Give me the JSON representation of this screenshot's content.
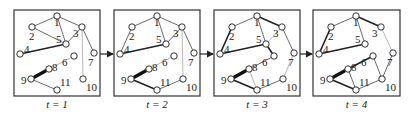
{
  "figure": {
    "panels": [
      {
        "label": "t = 1",
        "edges": [
          {
            "from": 1,
            "to": 2,
            "weight": "thin"
          },
          {
            "from": 1,
            "to": 3,
            "weight": "thin"
          },
          {
            "from": 1,
            "to": 5,
            "weight": "thin"
          },
          {
            "from": 2,
            "to": 5,
            "weight": "thin"
          },
          {
            "from": 3,
            "to": 5,
            "weight": "thin"
          },
          {
            "from": 3,
            "to": 7,
            "weight": "thin"
          },
          {
            "from": 3,
            "to": 10,
            "weight": "faint"
          },
          {
            "from": 4,
            "to": 5,
            "weight": "medium"
          },
          {
            "from": 8,
            "to": 6,
            "weight": "faint"
          },
          {
            "from": 9,
            "to": 8,
            "weight": "thick"
          },
          {
            "from": 9,
            "to": 11,
            "weight": "thin"
          }
        ]
      },
      {
        "label": "t = 2",
        "edges": [
          {
            "from": 1,
            "to": 2,
            "weight": "thin"
          },
          {
            "from": 1,
            "to": 3,
            "weight": "thin"
          },
          {
            "from": 1,
            "to": 5,
            "weight": "thin"
          },
          {
            "from": 2,
            "to": 4,
            "weight": "thin"
          },
          {
            "from": 3,
            "to": 5,
            "weight": "thin"
          },
          {
            "from": 3,
            "to": 7,
            "weight": "thin"
          },
          {
            "from": 3,
            "to": 10,
            "weight": "faint"
          },
          {
            "from": 4,
            "to": 5,
            "weight": "medium"
          },
          {
            "from": 8,
            "to": 6,
            "weight": "faint"
          },
          {
            "from": 9,
            "to": 8,
            "weight": "thick"
          },
          {
            "from": 9,
            "to": 11,
            "weight": "medium"
          },
          {
            "from": 11,
            "to": 10,
            "weight": "thin"
          }
        ]
      },
      {
        "label": "t = 3",
        "edges": [
          {
            "from": 1,
            "to": 2,
            "weight": "thin"
          },
          {
            "from": 1,
            "to": 3,
            "weight": "medium"
          },
          {
            "from": 1,
            "to": 5,
            "weight": "thin"
          },
          {
            "from": 2,
            "to": 4,
            "weight": "medium"
          },
          {
            "from": 3,
            "to": 5,
            "weight": "faint"
          },
          {
            "from": 3,
            "to": 7,
            "weight": "thin"
          },
          {
            "from": 4,
            "to": 5,
            "weight": "medium"
          },
          {
            "from": 5,
            "to": 6,
            "weight": "medium"
          },
          {
            "from": 7,
            "to": 10,
            "weight": "faint"
          },
          {
            "from": 6,
            "to": 8,
            "weight": "thin"
          },
          {
            "from": 8,
            "to": 11,
            "weight": "faint"
          },
          {
            "from": 9,
            "to": 8,
            "weight": "thick"
          },
          {
            "from": 9,
            "to": 11,
            "weight": "medium"
          },
          {
            "from": 11,
            "to": 10,
            "weight": "thin"
          }
        ]
      },
      {
        "label": "t = 4",
        "edges": [
          {
            "from": 1,
            "to": 2,
            "weight": "thin"
          },
          {
            "from": 1,
            "to": 3,
            "weight": "medium"
          },
          {
            "from": 1,
            "to": 5,
            "weight": "thin"
          },
          {
            "from": 2,
            "to": 4,
            "weight": "medium"
          },
          {
            "from": 3,
            "to": 7,
            "weight": "faint"
          },
          {
            "from": 4,
            "to": 5,
            "weight": "medium"
          },
          {
            "from": 6,
            "to": 8,
            "weight": "medium"
          },
          {
            "from": 6,
            "to": 10,
            "weight": "thin"
          },
          {
            "from": 7,
            "to": 10,
            "weight": "thin"
          },
          {
            "from": 8,
            "to": 11,
            "weight": "thin"
          },
          {
            "from": 9,
            "to": 8,
            "weight": "thick"
          },
          {
            "from": 9,
            "to": 11,
            "weight": "medium"
          },
          {
            "from": 11,
            "to": 10,
            "weight": "thin"
          }
        ]
      }
    ],
    "nodes": [
      {
        "id": 1,
        "label": "1"
      },
      {
        "id": 2,
        "label": "2"
      },
      {
        "id": 3,
        "label": "3"
      },
      {
        "id": 4,
        "label": "4"
      },
      {
        "id": 5,
        "label": "5"
      },
      {
        "id": 6,
        "label": "6"
      },
      {
        "id": 7,
        "label": "7"
      },
      {
        "id": 8,
        "label": "8"
      },
      {
        "id": 9,
        "label": "9"
      },
      {
        "id": 10,
        "label": "10"
      },
      {
        "id": 11,
        "label": "11"
      }
    ],
    "arrow_color": "#222222",
    "edge_color": "#333333"
  }
}
